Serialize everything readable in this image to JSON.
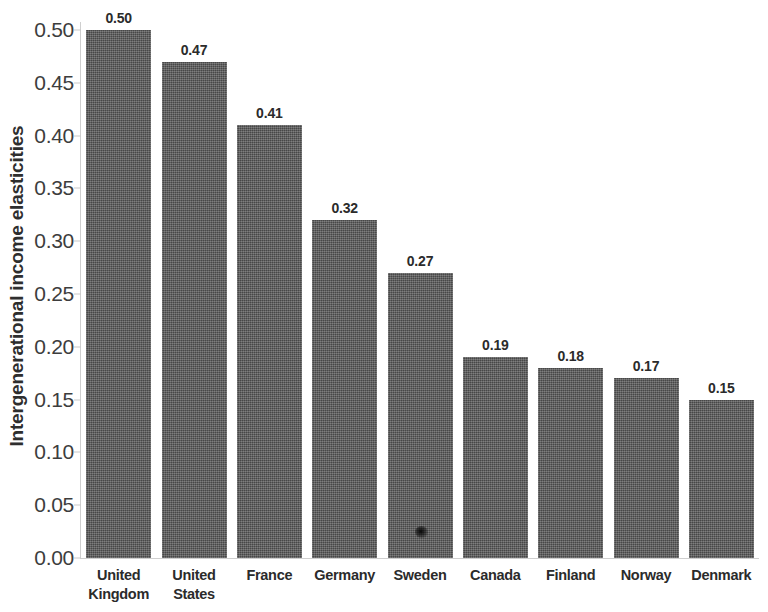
{
  "chart_data": {
    "type": "bar",
    "title": "",
    "xlabel": "",
    "ylabel": "Intergenerational income elasticities",
    "ylim": [
      0.0,
      0.5
    ],
    "grid": false,
    "legend": null,
    "orientation": "vertical",
    "bar_color": "#575757",
    "background_color": "#ffffff",
    "axis_color": "#cfcfcf",
    "categories": [
      "United Kingdom",
      "United States",
      "France",
      "Germany",
      "Sweden",
      "Canada",
      "Finland",
      "Norway",
      "Denmark"
    ],
    "category_lines": [
      [
        "United",
        "Kingdom"
      ],
      [
        "United",
        "States"
      ],
      [
        "France"
      ],
      [
        "Germany"
      ],
      [
        "Sweden"
      ],
      [
        "Canada"
      ],
      [
        "Finland"
      ],
      [
        "Norway"
      ],
      [
        "Denmark"
      ]
    ],
    "values": [
      0.5,
      0.47,
      0.41,
      0.32,
      0.27,
      0.19,
      0.18,
      0.17,
      0.15
    ],
    "value_labels": [
      "0.50",
      "0.47",
      "0.41",
      "0.32",
      "0.27",
      "0.19",
      "0.18",
      "0.17",
      "0.15"
    ],
    "y_ticks": [
      0.0,
      0.05,
      0.1,
      0.15,
      0.2,
      0.25,
      0.3,
      0.35,
      0.4,
      0.45,
      0.5
    ],
    "y_tick_labels": [
      "0.00",
      "0.05",
      "0.10",
      "0.15",
      "0.20",
      "0.25",
      "0.30",
      "0.35",
      "0.40",
      "0.45",
      "0.50"
    ]
  }
}
